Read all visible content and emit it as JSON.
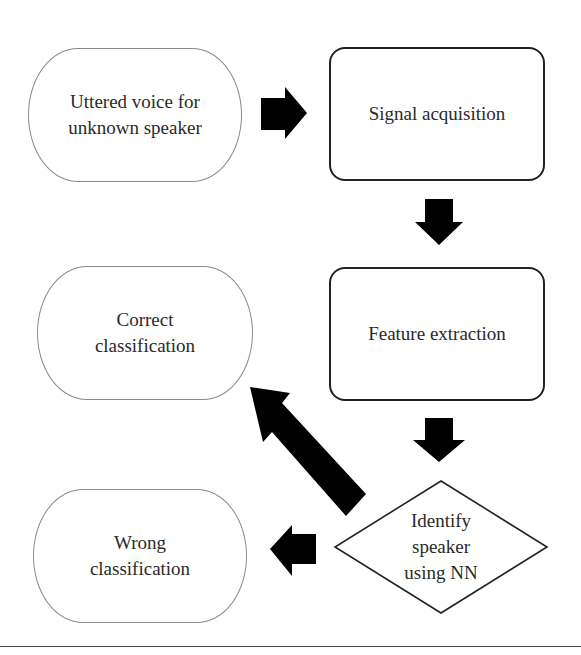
{
  "diagram": {
    "nodes": {
      "uttered_voice": {
        "label": "Uttered voice for\nunknown speaker",
        "shape": "terminal"
      },
      "signal_acquisition": {
        "label": "Signal acquisition",
        "shape": "process"
      },
      "feature_extraction": {
        "label": "Feature extraction",
        "shape": "process"
      },
      "identify_speaker": {
        "label": "Identify\nspeaker\nusing NN",
        "shape": "decision"
      },
      "correct_classification": {
        "label": "Correct\nclassification",
        "shape": "terminal"
      },
      "wrong_classification": {
        "label": "Wrong\nclassification",
        "shape": "terminal"
      }
    },
    "edges": [
      {
        "from": "uttered_voice",
        "to": "signal_acquisition",
        "direction": "right"
      },
      {
        "from": "signal_acquisition",
        "to": "feature_extraction",
        "direction": "down"
      },
      {
        "from": "feature_extraction",
        "to": "identify_speaker",
        "direction": "down"
      },
      {
        "from": "identify_speaker",
        "to": "correct_classification",
        "direction": "up-left"
      },
      {
        "from": "identify_speaker",
        "to": "wrong_classification",
        "direction": "left"
      }
    ],
    "colors": {
      "arrow": "#000000",
      "terminal_border": "#8a8a8a",
      "process_border": "#222222",
      "text": "#2a2a2a"
    }
  }
}
